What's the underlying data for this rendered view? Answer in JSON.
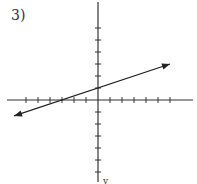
{
  "problem": {
    "number_label": "3)"
  },
  "axis_label_bottom": "y",
  "colors": {
    "axis": "#333333",
    "line": "#222222"
  },
  "chart_data": {
    "type": "line",
    "title": "3)",
    "xlabel": "x",
    "ylabel": "y",
    "xlim": [
      -7.5,
      8
    ],
    "ylim": [
      -7,
      8
    ],
    "grid": false,
    "x_ticks": [
      -6,
      -5,
      -4,
      -3,
      -2,
      -1,
      1,
      2,
      3,
      4,
      5,
      6
    ],
    "y_ticks": [
      -6,
      -5,
      -4,
      -3,
      -2,
      -1,
      1,
      2,
      3,
      4,
      5,
      6
    ],
    "series": [
      {
        "name": "line",
        "equation": "y = (1/3)x + 1",
        "slope": 0.3333,
        "intercept": 1,
        "x": [
          -7,
          -3,
          0,
          6
        ],
        "y": [
          -1.33,
          0,
          1,
          3
        ],
        "arrows": "both"
      }
    ]
  }
}
